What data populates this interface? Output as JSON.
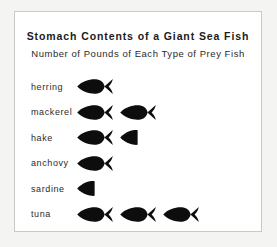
{
  "chart_data": {
    "type": "pictograph",
    "title": "Stomach Contents of a Giant Sea Fish",
    "subtitle": "Number of Pounds of Each Type of Prey Fish",
    "xlabel": "",
    "ylabel": "",
    "symbol": "fish-icon",
    "symbol_unit_value": 1,
    "symbol_unit_label": "pound",
    "value_unit": "pounds",
    "symbol_color": "#0d0d0d",
    "grid": false,
    "legend": false,
    "categories": [
      "herring",
      "mackerel",
      "hake",
      "anchovy",
      "sardine",
      "tuna"
    ],
    "values": [
      1,
      2,
      1.5,
      1,
      0.5,
      3
    ],
    "rows": [
      {
        "label": "herring",
        "value": 1,
        "full_symbols": 1,
        "half_symbols": 0
      },
      {
        "label": "mackerel",
        "value": 2,
        "full_symbols": 2,
        "half_symbols": 0
      },
      {
        "label": "hake",
        "value": 1.5,
        "full_symbols": 1,
        "half_symbols": 1
      },
      {
        "label": "anchovy",
        "value": 1,
        "full_symbols": 1,
        "half_symbols": 0
      },
      {
        "label": "sardine",
        "value": 0.5,
        "full_symbols": 0,
        "half_symbols": 1
      },
      {
        "label": "tuna",
        "value": 3,
        "full_symbols": 3,
        "half_symbols": 0
      }
    ]
  },
  "card": {
    "background": "#ffffff",
    "border_color": "#c9c9c9"
  },
  "page": {
    "background": "#f4f4f2"
  }
}
